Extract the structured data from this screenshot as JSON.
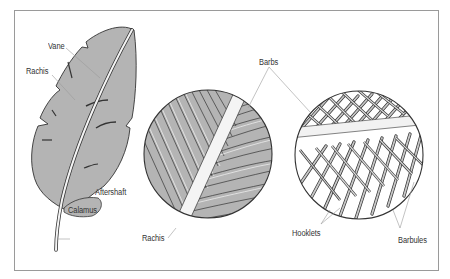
{
  "diagram": {
    "labels": {
      "vane": "Vane",
      "rachis_feather": "Rachis",
      "aftershaft": "Aftershaft",
      "calamus": "Calamus",
      "barbs": "Barbs",
      "rachis_detail": "Rachis",
      "hooklets": "Hooklets",
      "barbules": "Barbules"
    },
    "colors": {
      "feather_fill": "#b4b4b4",
      "outline": "#333333",
      "shaft": "#f4f4f4",
      "leader_line": "#9a9a9a",
      "frame": "#9a9a9a"
    }
  }
}
